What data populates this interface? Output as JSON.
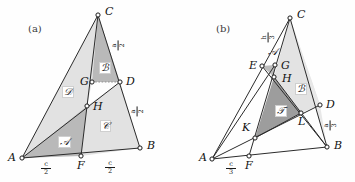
{
  "figure": {
    "panels": [
      {
        "id": "a",
        "caption": "(a)",
        "vertices": [
          {
            "name": "A",
            "label": "A",
            "x": 22,
            "y": 158
          },
          {
            "name": "B",
            "label": "B",
            "x": 140,
            "y": 148
          },
          {
            "name": "C",
            "label": "C",
            "x": 98,
            "y": 15
          },
          {
            "name": "D",
            "label": "D",
            "x": 120,
            "y": 82
          },
          {
            "name": "F",
            "label": "F",
            "x": 81,
            "y": 156
          },
          {
            "name": "G",
            "label": "G",
            "x": 92,
            "y": 82
          },
          {
            "name": "H",
            "label": "H",
            "x": 87,
            "y": 106
          }
        ],
        "regions": [
          {
            "name": "A",
            "label": "A",
            "script": "𝒜",
            "x": 62,
            "y": 140,
            "shade": "#b9b9b9"
          },
          {
            "name": "B",
            "label": "B",
            "script": "ℬ",
            "x": 103,
            "y": 66,
            "shade": "#b9b9b9"
          },
          {
            "name": "C",
            "label": "C",
            "script": "𝒞",
            "x": 104,
            "y": 124,
            "shade": "#e2e2e2"
          },
          {
            "name": "D",
            "label": "D",
            "script": "𝒟",
            "x": 67,
            "y": 90,
            "shade": "#e2e2e2"
          }
        ],
        "measures": [
          {
            "name": "bottom-left-segment",
            "num": "c",
            "den": "2",
            "x": 46,
            "y": 167,
            "rotated": false
          },
          {
            "name": "bottom-right-segment",
            "num": "c",
            "den": "2",
            "x": 110,
            "y": 166,
            "rotated": false
          },
          {
            "name": "upper-right-segment",
            "num": "a",
            "den": "2",
            "x": 118,
            "y": 44,
            "rotated": true
          },
          {
            "name": "lower-right-segment",
            "num": "a",
            "den": "2",
            "x": 137,
            "y": 110,
            "rotated": true
          }
        ]
      },
      {
        "id": "b",
        "caption": "(b)",
        "vertices": [
          {
            "name": "A",
            "label": "A",
            "x": 212,
            "y": 159
          },
          {
            "name": "B",
            "label": "B",
            "x": 327,
            "y": 147
          },
          {
            "name": "C",
            "label": "C",
            "x": 290,
            "y": 18
          },
          {
            "name": "D",
            "label": "D",
            "x": 320,
            "y": 105
          },
          {
            "name": "E",
            "label": "E",
            "x": 262,
            "y": 66
          },
          {
            "name": "F",
            "label": "F",
            "x": 249,
            "y": 156
          },
          {
            "name": "G",
            "label": "G",
            "x": 275,
            "y": 65
          },
          {
            "name": "H",
            "label": "H",
            "x": 274,
            "y": 77
          },
          {
            "name": "K",
            "label": "K",
            "x": 255,
            "y": 138
          },
          {
            "name": "L",
            "label": "L",
            "x": 301,
            "y": 113
          }
        ],
        "regions": [
          {
            "name": "A",
            "label": "A",
            "script": "𝒜",
            "x": 271,
            "y": 52,
            "shade": "#bcbcbc"
          },
          {
            "name": "B",
            "label": "B",
            "script": "ℬ",
            "x": 299,
            "y": 87,
            "shade": "#e3e3e3"
          },
          {
            "name": "T",
            "label": "T",
            "script": "𝒯",
            "x": 280,
            "y": 110,
            "shade": "#9d9d9d"
          }
        ],
        "measures": [
          {
            "name": "bottom-left-segment",
            "num": "c",
            "den": "3",
            "x": 231,
            "y": 167,
            "rotated": false
          },
          {
            "name": "apex-segment",
            "num": "h",
            "den": "3",
            "x": 268,
            "y": 36,
            "rotated": true
          },
          {
            "name": "right-segment",
            "num": "a",
            "den": "3",
            "x": 330,
            "y": 124,
            "rotated": true
          }
        ]
      }
    ]
  },
  "style": {
    "line_color": "#2b2b2b",
    "dashed_color": "#7b7b7b",
    "vertex_fill": "#ffffff",
    "vertex_stroke": "#1b1b1b",
    "background": "#fefefe"
  }
}
